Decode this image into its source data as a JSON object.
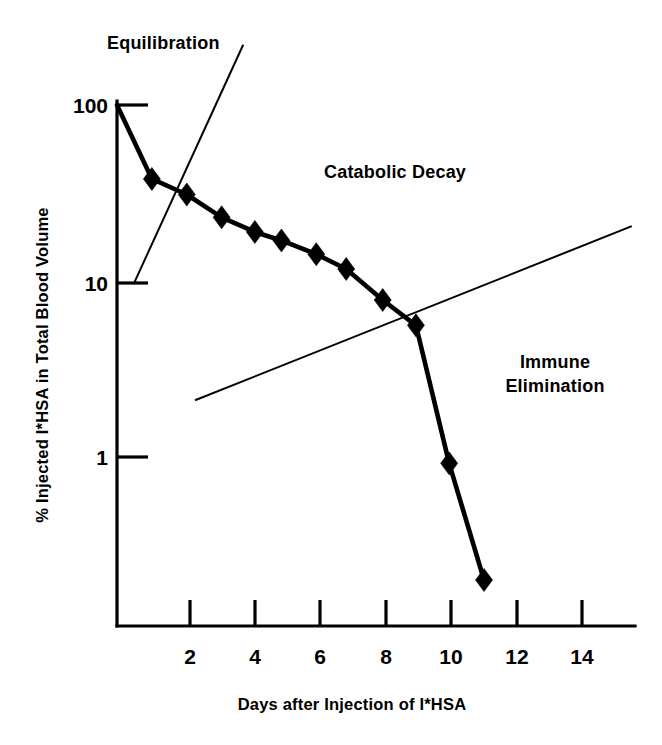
{
  "chart_data": {
    "type": "line",
    "title": "",
    "xlabel": "Days after Injection of I*HSA",
    "ylabel": "% Injected I*HSA in Total Blood Volume",
    "yscale": "log",
    "ylim": [
      0.13,
      100
    ],
    "xlim": [
      0,
      14.6
    ],
    "grid": false,
    "legend": false,
    "x_ticks": [
      "2",
      "4",
      "6",
      "8",
      "10",
      "12",
      "14"
    ],
    "x_tick_values": [
      2,
      4,
      6,
      8,
      10,
      12,
      14
    ],
    "y_ticks": [
      "100",
      "10",
      "1"
    ],
    "y_tick_values": [
      100,
      10,
      1
    ],
    "series": [
      {
        "name": "I*HSA in total blood volume",
        "marker": "filled-diamond",
        "x": [
          0.0,
          1.05,
          2.1,
          3.15,
          4.15,
          4.95,
          6.0,
          6.9,
          8.0,
          9.0,
          10.0,
          11.05
        ],
        "values": [
          100,
          38,
          31,
          23,
          19,
          17,
          14.2,
          11.7,
          7.8,
          5.6,
          0.92,
          0.2
        ]
      }
    ],
    "trend_lines": [
      {
        "name": "equilibration-trend",
        "x": [
          0.5,
          3.8
        ],
        "values": [
          9.6,
          220
        ]
      },
      {
        "name": "immune-elimination-trend",
        "x": [
          2.35,
          15.5
        ],
        "values": [
          2.1,
          20.5
        ]
      }
    ],
    "annotations": [
      {
        "name": "equilibration-label",
        "text": "Equilibration",
        "x": 1.0,
        "y": 330
      },
      {
        "name": "catabolic-decay-label",
        "text": "Catabolic Decay",
        "x": 7.1,
        "y": 42
      },
      {
        "name": "immune-elimination-label",
        "text": "Immune\nElimination",
        "x": 12.1,
        "y": 2.6
      }
    ]
  },
  "labels": {
    "y_100": "100",
    "y_10": "10",
    "y_1": "1",
    "x_2": "2",
    "x_4": "4",
    "x_6": "6",
    "x_8": "8",
    "x_10": "10",
    "x_12": "12",
    "x_14": "14",
    "x_axis_title": "Days after Injection of I*HSA",
    "y_axis_title": "% Injected I*HSA in Total Blood Volume",
    "region_equilibration": "Equilibration",
    "region_catabolic": "Catabolic Decay",
    "region_immune_line1": "Immune",
    "region_immune_line2": "Elimination"
  },
  "colors": {
    "ink": "#000000",
    "background": "#ffffff"
  }
}
